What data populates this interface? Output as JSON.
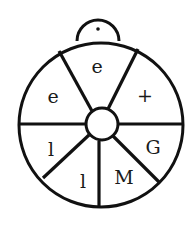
{
  "diagram": {
    "type": "wheel-with-handle",
    "segments": [
      {
        "position": "top",
        "label": "e"
      },
      {
        "position": "upper-right",
        "label": "+"
      },
      {
        "position": "lower-right",
        "label": "G"
      },
      {
        "position": "bottom-right",
        "label": "M"
      },
      {
        "position": "bottom-left",
        "label": "l"
      },
      {
        "position": "lower-left",
        "label": "l"
      },
      {
        "position": "upper-left",
        "label": "e"
      }
    ],
    "colors": {
      "stroke": "#111111",
      "background": "#ffffff"
    }
  }
}
